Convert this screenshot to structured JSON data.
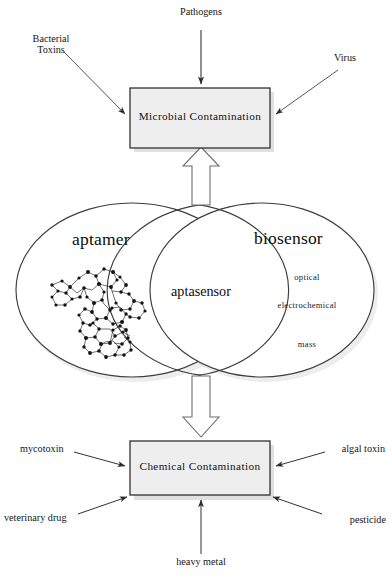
{
  "figure": {
    "nodes": {
      "microbial_box": {
        "label": "Microbial Contamination",
        "fill": "#eeeeee",
        "stroke": "#222222"
      },
      "chemical_box": {
        "label": "Chemical Contamination",
        "fill": "#eeeeee",
        "stroke": "#222222"
      }
    },
    "microbial_inputs": [
      {
        "label": "Pathogens",
        "position": "top"
      },
      {
        "label": "Bacterial\nToxins",
        "position": "top-left"
      },
      {
        "label": "Virus",
        "position": "top-right"
      }
    ],
    "chemical_inputs": [
      {
        "label": "mycotoxin",
        "position": "left-upper"
      },
      {
        "label": "algal toxin",
        "position": "right-upper"
      },
      {
        "label": "veterinary drug",
        "position": "left-lower"
      },
      {
        "label": "pesticide",
        "position": "right-lower"
      },
      {
        "label": "heavy metal",
        "position": "bottom"
      }
    ],
    "venn": {
      "left_ellipse": {
        "label": "aptamer",
        "illustration": "nucleic-acid-structure-sketch"
      },
      "right_ellipse": {
        "label": "biosensor",
        "items": [
          "optical",
          "electrochemical",
          "mass"
        ]
      },
      "intersection": {
        "label": "aptasensor"
      },
      "stroke": "#3a3a3a"
    },
    "block_arrows": [
      {
        "direction": "up",
        "from": "venn",
        "to": "microbial_box",
        "style": "hollow-outline"
      },
      {
        "direction": "down",
        "from": "venn",
        "to": "chemical_box",
        "style": "hollow-outline"
      }
    ],
    "colors": {
      "line": "#333333",
      "box_fill": "#eeeeee",
      "box_stroke": "#222222",
      "text": "#111111",
      "shadow": "#bfbfbf"
    }
  }
}
